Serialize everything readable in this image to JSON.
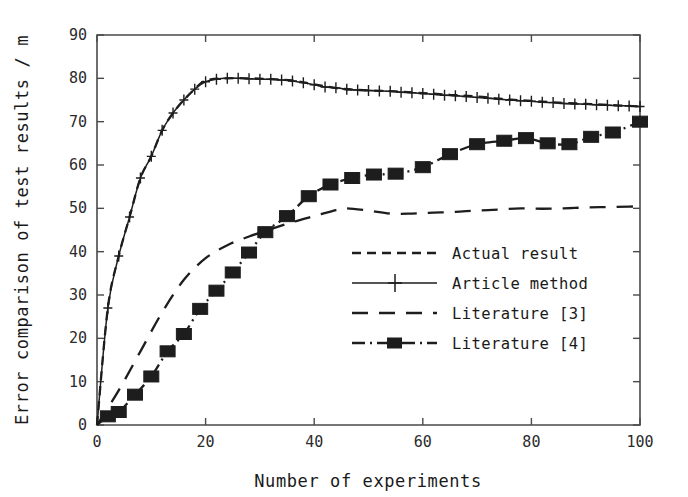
{
  "chart_data": {
    "type": "line",
    "title": "",
    "xlabel": "Number of experiments",
    "ylabel": "Error comparison of test results / m",
    "xlim": [
      0,
      100
    ],
    "ylim": [
      0,
      90
    ],
    "xticks": [
      0,
      20,
      40,
      60,
      80,
      100
    ],
    "yticks": [
      0,
      10,
      20,
      30,
      40,
      50,
      60,
      70,
      80,
      90
    ],
    "xtick_labels": [
      "0",
      "20",
      "40",
      "60",
      "80",
      "100"
    ],
    "ytick_labels": [
      "0",
      "10",
      "20",
      "30",
      "40",
      "50",
      "60",
      "70",
      "80",
      "90"
    ],
    "grid": false,
    "legend_position": "center-right-inside",
    "series": [
      {
        "name": "Actual result",
        "style": "dashed",
        "marker": "none",
        "color": "#1d1d1d",
        "x": [
          0,
          2,
          4,
          6,
          8,
          10,
          12,
          14,
          16,
          18,
          20,
          24,
          28,
          32,
          36,
          40,
          45,
          50,
          55,
          60,
          65,
          70,
          75,
          80,
          85,
          90,
          95,
          100
        ],
        "y": [
          0,
          27,
          39,
          48,
          57,
          62,
          68,
          72,
          75,
          77.5,
          79.5,
          80,
          80,
          79.8,
          79.5,
          78.6,
          77.6,
          77.2,
          77.0,
          76.6,
          76.2,
          75.8,
          75.2,
          74.8,
          74.4,
          74.1,
          73.8,
          73.5
        ]
      },
      {
        "name": "Article method",
        "style": "solid",
        "marker": "plus",
        "color": "#1d1d1d",
        "x": [
          0,
          2,
          4,
          6,
          8,
          10,
          12,
          14,
          16,
          18,
          20,
          22,
          24,
          26,
          28,
          30,
          32,
          34,
          36,
          38,
          40,
          42,
          44,
          46,
          48,
          50,
          52,
          54,
          56,
          58,
          60,
          62,
          64,
          66,
          68,
          70,
          72,
          74,
          76,
          78,
          80,
          82,
          84,
          86,
          88,
          90,
          92,
          94,
          96,
          98,
          100
        ],
        "y": [
          0,
          27,
          39,
          48,
          57,
          62,
          68,
          72,
          75,
          77.5,
          79.2,
          79.8,
          80.0,
          80.0,
          79.9,
          79.8,
          79.8,
          79.6,
          79.4,
          79.0,
          78.5,
          78.0,
          77.8,
          77.5,
          77.3,
          77.2,
          77.1,
          77.0,
          76.8,
          76.7,
          76.5,
          76.3,
          76.1,
          76.0,
          75.8,
          75.6,
          75.4,
          75.2,
          75.0,
          74.8,
          74.7,
          74.5,
          74.4,
          74.2,
          74.1,
          74.0,
          73.9,
          73.8,
          73.7,
          73.6,
          73.5
        ]
      },
      {
        "name": "Literature [3]",
        "style": "longdash",
        "marker": "none",
        "color": "#1d1d1d",
        "x": [
          0,
          4,
          8,
          12,
          16,
          20,
          24,
          28,
          32,
          36,
          40,
          44,
          46,
          50,
          54,
          58,
          62,
          66,
          70,
          74,
          78,
          82,
          86,
          90,
          94,
          98,
          100
        ],
        "y": [
          0,
          8,
          17,
          26,
          33.5,
          38.5,
          41.5,
          43.5,
          45.2,
          46.8,
          48.2,
          49.6,
          50.0,
          49.5,
          48.8,
          48.8,
          49.0,
          49.2,
          49.5,
          49.7,
          50.0,
          49.9,
          50.0,
          50.2,
          50.3,
          50.4,
          50.5
        ]
      },
      {
        "name": "Literature [4]",
        "style": "dashdot",
        "marker": "square",
        "color": "#1d1d1d",
        "x": [
          0,
          2,
          4,
          7,
          10,
          13,
          16,
          19,
          22,
          25,
          28,
          31,
          35,
          39,
          43,
          47,
          51,
          55,
          60,
          65,
          70,
          75,
          79,
          83,
          87,
          91,
          95,
          100
        ],
        "y": [
          0,
          2.0,
          3.0,
          7.0,
          11.2,
          17.0,
          21.0,
          26.8,
          31.0,
          35.2,
          39.8,
          44.5,
          48.2,
          52.8,
          55.5,
          57.0,
          57.8,
          58.0,
          59.5,
          62.5,
          64.8,
          65.6,
          66.2,
          65.0,
          64.8,
          66.5,
          67.5,
          70.0
        ]
      }
    ]
  },
  "legend": {
    "items": [
      {
        "label": "Actual result",
        "style": "dashed",
        "marker": "none"
      },
      {
        "label": "Article method",
        "style": "solid",
        "marker": "plus"
      },
      {
        "label": "Literature [3]",
        "style": "longdash",
        "marker": "none"
      },
      {
        "label": "Literature [4]",
        "style": "dashdot",
        "marker": "square"
      }
    ]
  },
  "axes": {
    "x_title": "Number of experiments",
    "y_title": "Error comparison of test results / m"
  }
}
